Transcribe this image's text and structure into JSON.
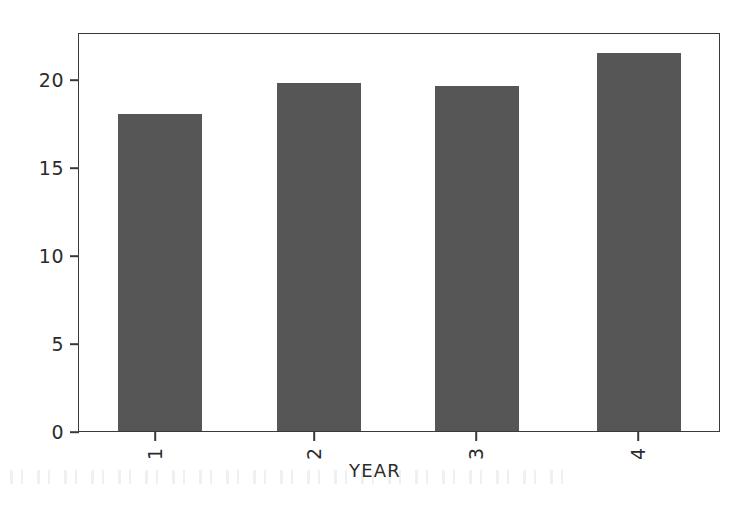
{
  "chart_data": {
    "type": "bar",
    "title": "",
    "subtitle": "",
    "xlabel": "YEAR",
    "ylabel": "",
    "categories": [
      "1",
      "2",
      "3",
      "4"
    ],
    "values": [
      18.1,
      19.9,
      19.7,
      21.6
    ],
    "series": [
      {
        "name": "",
        "values": [
          18.1,
          19.9,
          19.7,
          21.6
        ]
      }
    ],
    "ylim": [
      0,
      22.7
    ],
    "yticks": [
      0,
      5,
      10,
      15,
      20
    ],
    "ytick_labels": [
      "0",
      "5",
      "10",
      "15",
      "20"
    ],
    "xtick_labels": [
      "1",
      "2",
      "3",
      "4"
    ],
    "xtick_rotation": 90,
    "grid": false,
    "legend": null,
    "legend_position": "none",
    "bar_color": "#565656",
    "axis_color": "#3a3a3a",
    "background_color": "#ffffff",
    "annotations": []
  },
  "figure": {
    "axis_title_x": "YEAR"
  }
}
